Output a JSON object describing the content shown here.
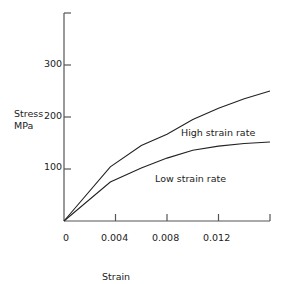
{
  "chart_data": {
    "type": "line",
    "title": "",
    "xlabel": "Strain",
    "ylabel": "Stress MPa",
    "ylabel_lines": [
      "Stress",
      "MPa"
    ],
    "xlim": [
      0,
      0.016
    ],
    "ylim": [
      0,
      360
    ],
    "x_ticks": [
      "0",
      "0.004",
      "0.008",
      "0.012"
    ],
    "y_ticks": [
      "100",
      "200",
      "300"
    ],
    "grid": false,
    "legend": "inline annotations",
    "series": [
      {
        "name": "High strain rate",
        "x": [
          0,
          0.0036,
          0.006,
          0.008,
          0.01,
          0.012,
          0.014,
          0.016
        ],
        "y": [
          0,
          104,
          145,
          167,
          195,
          217,
          235,
          250
        ]
      },
      {
        "name": "Low strain rate",
        "x": [
          0,
          0.0036,
          0.006,
          0.008,
          0.01,
          0.012,
          0.014,
          0.016
        ],
        "y": [
          0,
          75,
          102,
          121,
          136,
          144,
          149,
          152
        ]
      }
    ],
    "annotations": [
      "High strain rate",
      "Low strain rate"
    ]
  }
}
